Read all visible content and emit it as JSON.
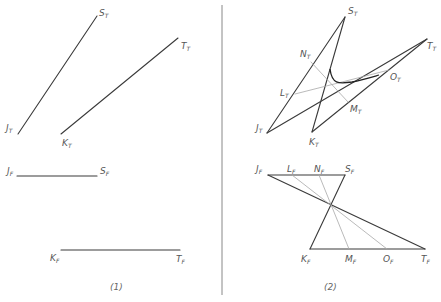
{
  "figure": {
    "panels": [
      {
        "id": "panel-1",
        "caption": "(1)",
        "caption_pos": [
          110,
          290
        ],
        "top_view": {
          "segments": [
            {
              "from": "J_T",
              "to": "S_T",
              "x1": 18,
              "y1": 134,
              "x2": 97,
              "y2": 16
            },
            {
              "from": "K_T",
              "to": "T_T",
              "x1": 61,
              "y1": 134,
              "x2": 178,
              "y2": 38
            }
          ],
          "labels": [
            {
              "main": "S",
              "sub": "T",
              "x": 99,
              "y": 16
            },
            {
              "main": "T",
              "sub": "T",
              "x": 181,
              "y": 49
            },
            {
              "main": "J",
              "sub": "T",
              "x": 6,
              "y": 131
            },
            {
              "main": "K",
              "sub": "T",
              "x": 62,
              "y": 146
            }
          ]
        },
        "front_view": {
          "segments": [
            {
              "from": "J_F",
              "to": "S_F",
              "x1": 17,
              "y1": 176,
              "x2": 97,
              "y2": 176
            },
            {
              "from": "K_F",
              "to": "T_F",
              "x1": 61,
              "y1": 250,
              "x2": 180,
              "y2": 250
            }
          ],
          "labels": [
            {
              "main": "J",
              "sub": "F",
              "x": 7,
              "y": 174
            },
            {
              "main": "S",
              "sub": "F",
              "x": 100,
              "y": 174
            },
            {
              "main": "K",
              "sub": "F",
              "x": 50,
              "y": 261
            },
            {
              "main": "T",
              "sub": "F",
              "x": 176,
              "y": 262
            }
          ]
        }
      },
      {
        "id": "panel-2",
        "caption": "(2)",
        "caption_pos": [
          324,
          290
        ],
        "top_view": {
          "segments": [
            {
              "from": "J_T",
              "to": "S_T",
              "x1": 267,
              "y1": 133,
              "x2": 345,
              "y2": 17,
              "weight": "dark"
            },
            {
              "from": "K_T",
              "to": "S_T",
              "x1": 312,
              "y1": 132,
              "x2": 345,
              "y2": 17,
              "weight": "dark"
            },
            {
              "from": "J_T",
              "to": "T_T",
              "x1": 267,
              "y1": 133,
              "x2": 427,
              "y2": 39,
              "weight": "dark"
            },
            {
              "from": "K_T",
              "to": "T_T",
              "x1": 312,
              "y1": 132,
              "x2": 427,
              "y2": 39,
              "weight": "dark"
            },
            {
              "from": "N_T",
              "to": "M_T",
              "x1": 311,
              "y1": 62,
              "x2": 348,
              "y2": 102,
              "weight": "light"
            },
            {
              "from": "L_T",
              "to": "O_T",
              "x1": 295,
              "y1": 94,
              "x2": 389,
              "y2": 70,
              "weight": "light"
            }
          ],
          "curve": {
            "path": "M 330 69 C 332 84, 338 84, 352 82 C 362 80, 372 77, 379 75"
          },
          "labels": [
            {
              "main": "S",
              "sub": "T",
              "x": 348,
              "y": 14
            },
            {
              "main": "T",
              "sub": "T",
              "x": 427,
              "y": 49
            },
            {
              "main": "N",
              "sub": "T",
              "x": 300,
              "y": 57
            },
            {
              "main": "O",
              "sub": "T",
              "x": 390,
              "y": 80
            },
            {
              "main": "L",
              "sub": "T",
              "x": 280,
              "y": 96
            },
            {
              "main": "M",
              "sub": "T",
              "x": 350,
              "y": 112
            },
            {
              "main": "J",
              "sub": "T",
              "x": 256,
              "y": 131
            },
            {
              "main": "K",
              "sub": "T",
              "x": 309,
              "y": 145
            }
          ]
        },
        "front_view": {
          "segments": [
            {
              "from": "J_F",
              "to": "S_F",
              "x1": 268,
              "y1": 175,
              "x2": 345,
              "y2": 175,
              "weight": "dark"
            },
            {
              "from": "K_F",
              "to": "T_F",
              "x1": 310,
              "y1": 249,
              "x2": 425,
              "y2": 249,
              "weight": "dark"
            },
            {
              "from": "J_F",
              "to": "T_F",
              "x1": 268,
              "y1": 175,
              "x2": 425,
              "y2": 249,
              "weight": "dark"
            },
            {
              "from": "K_F",
              "to": "S_F",
              "x1": 310,
              "y1": 249,
              "x2": 345,
              "y2": 175,
              "weight": "dark"
            },
            {
              "from": "L_F",
              "to": "O_F",
              "x1": 292,
              "y1": 175,
              "x2": 387,
              "y2": 249,
              "weight": "light"
            },
            {
              "from": "N_F",
              "to": "M_F",
              "x1": 319,
              "y1": 175,
              "x2": 349,
              "y2": 249,
              "weight": "light"
            }
          ],
          "labels": [
            {
              "main": "J",
              "sub": "F",
              "x": 256,
              "y": 172
            },
            {
              "main": "L",
              "sub": "F",
              "x": 287,
              "y": 172
            },
            {
              "main": "N",
              "sub": "F",
              "x": 314,
              "y": 172
            },
            {
              "main": "S",
              "sub": "F",
              "x": 345,
              "y": 172
            },
            {
              "main": "K",
              "sub": "F",
              "x": 301,
              "y": 262
            },
            {
              "main": "M",
              "sub": "F",
              "x": 345,
              "y": 262
            },
            {
              "main": "O",
              "sub": "F",
              "x": 383,
              "y": 262
            },
            {
              "main": "T",
              "sub": "F",
              "x": 421,
              "y": 262
            }
          ]
        }
      }
    ],
    "divider": {
      "x": 222,
      "y1": 5,
      "y2": 295
    },
    "colors": {
      "dark_line": "#3a3a3a",
      "light_line": "#a8a8a8",
      "divider": "#7a7a7a",
      "label": "#555555"
    }
  }
}
